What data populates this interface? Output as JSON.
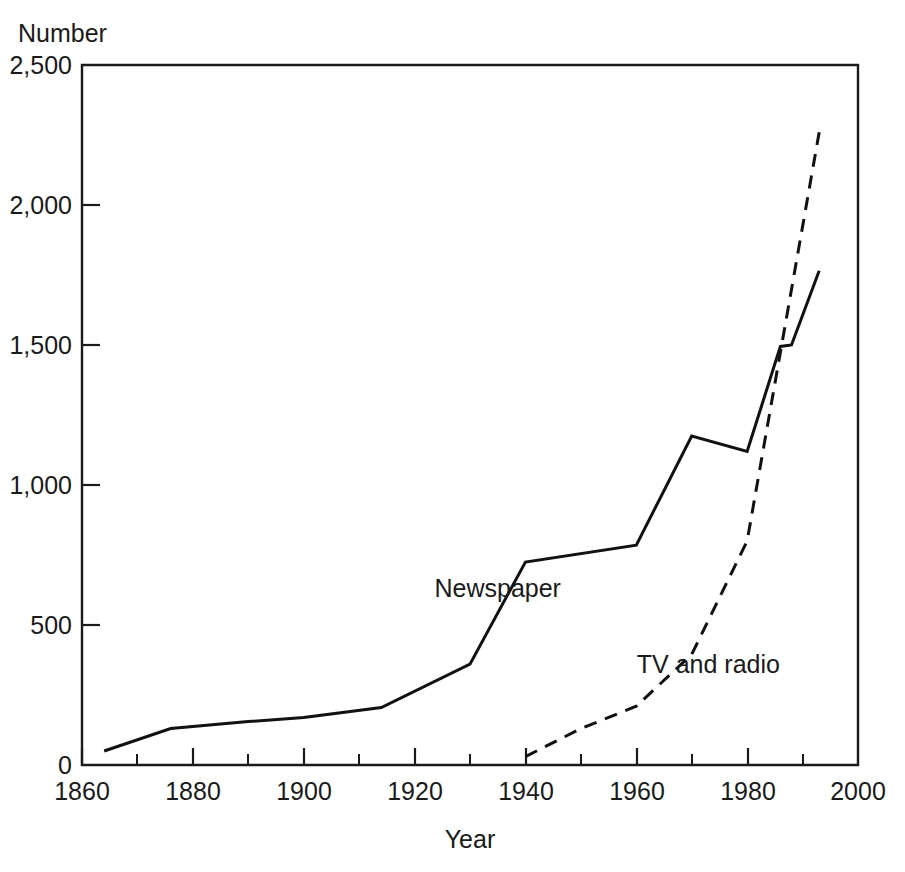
{
  "chart_data": {
    "type": "line",
    "title": "",
    "ylabel": "Number",
    "xlabel": "Year",
    "xlim": [
      1860,
      2000
    ],
    "ylim": [
      0,
      2500
    ],
    "grid": false,
    "legend_position": "inline-annotations",
    "x_ticks": [
      "1860",
      "1880",
      "1900",
      "1920",
      "1940",
      "1960",
      "1980",
      "2000"
    ],
    "x_tick_values": [
      1860,
      1880,
      1900,
      1920,
      1940,
      1960,
      1980,
      2000
    ],
    "x_minor_tick_values": [
      1870,
      1890,
      1910,
      1930,
      1950,
      1970,
      1990
    ],
    "y_ticks": [
      "0",
      "500",
      "1,000",
      "1,500",
      "2,000",
      "2,500"
    ],
    "y_tick_values": [
      0,
      500,
      1000,
      1500,
      2000,
      2500
    ],
    "series": [
      {
        "name": "Newspaper",
        "style": "solid",
        "label_x": 1935,
        "label_y": 600,
        "points": [
          [
            1864,
            50
          ],
          [
            1876,
            130
          ],
          [
            1890,
            155
          ],
          [
            1900,
            170
          ],
          [
            1914,
            205
          ],
          [
            1930,
            360
          ],
          [
            1940,
            725
          ],
          [
            1960,
            785
          ],
          [
            1970,
            1175
          ],
          [
            1980,
            1120
          ],
          [
            1986,
            1495
          ],
          [
            1988,
            1500
          ],
          [
            1993,
            1765
          ]
        ]
      },
      {
        "name": "TV and radio",
        "style": "dashed",
        "label_x": 1973,
        "label_y": 330,
        "points": [
          [
            1940,
            30
          ],
          [
            1950,
            130
          ],
          [
            1960,
            210
          ],
          [
            1970,
            395
          ],
          [
            1980,
            800
          ],
          [
            1993,
            2260
          ]
        ]
      }
    ]
  },
  "labels": {
    "y_axis_title": "Number",
    "x_axis_title": "Year",
    "series_newspaper": "Newspaper",
    "series_tv_radio": "TV and radio"
  },
  "colors": {
    "ink": "#111111",
    "background": "#ffffff"
  }
}
